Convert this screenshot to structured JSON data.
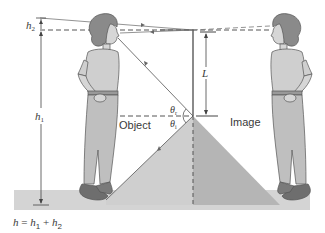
{
  "figure": {
    "labels": {
      "h2": "h",
      "h2_sub": "2",
      "h1": "h",
      "h1_sub": "1",
      "L": "L",
      "theta_r": "θ",
      "theta_r_sub": "r",
      "theta_i": "θ",
      "theta_i_sub": "i",
      "object": "Object",
      "image": "Image"
    },
    "formula": {
      "h": "h",
      "eq": " = ",
      "h1": "h",
      "h1_sub": "1",
      "plus": " + ",
      "h2": "h",
      "h2_sub": "2"
    },
    "colors": {
      "floor": "#d4d4d4",
      "triangle_object": "#cfcfcf",
      "triangle_image": "#b8b8b8",
      "person_fill": "#c8c8c8",
      "hair": "#8a8a8a",
      "shoes": "#6e6e6e",
      "line": "#4a4a4a"
    }
  }
}
